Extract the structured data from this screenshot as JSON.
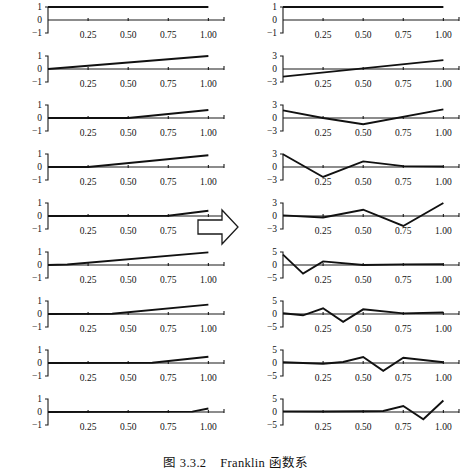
{
  "figure": {
    "caption_label": "图",
    "caption_number": "3.3.2",
    "caption_text": "Franklin 函数系",
    "arrow_icon": "right-block-arrow-icon",
    "line_color": "#111111",
    "axis_color": "#1a1a1a",
    "background_color": "#ffffff"
  },
  "chart_data": [
    {
      "type": "line",
      "panel_id": "left-1",
      "column": "left",
      "index": 1,
      "title": "",
      "xlabel": "",
      "ylabel": "",
      "xlim": [
        0,
        1.06
      ],
      "ylim": [
        -1,
        1
      ],
      "yticks": [
        1,
        0,
        -1
      ],
      "yticklabels": [
        "1",
        "0",
        "-1"
      ],
      "xticks": [
        0.25,
        0.5,
        0.75,
        1.0
      ],
      "xticklabels": [
        "0.25",
        "0.50",
        "0.75",
        "1.00"
      ],
      "grid": false,
      "legend": "none",
      "x": [
        0,
        1
      ],
      "y": [
        1,
        1
      ]
    },
    {
      "type": "line",
      "panel_id": "left-2",
      "column": "left",
      "index": 2,
      "xlim": [
        0,
        1.06
      ],
      "ylim": [
        -1,
        1
      ],
      "yticks": [
        1,
        0,
        -1
      ],
      "yticklabels": [
        "1",
        "0",
        "-1"
      ],
      "xticks": [
        0.25,
        0.5,
        0.75,
        1.0
      ],
      "xticklabels": [
        "0.25",
        "0.50",
        "0.75",
        "1.00"
      ],
      "grid": false,
      "x": [
        0,
        1
      ],
      "y": [
        0,
        1
      ]
    },
    {
      "type": "line",
      "panel_id": "left-3",
      "column": "left",
      "index": 3,
      "xlim": [
        0,
        1.06
      ],
      "ylim": [
        -1,
        1
      ],
      "yticks": [
        1,
        0,
        -1
      ],
      "yticklabels": [
        "1",
        "0",
        "-1"
      ],
      "xticks": [
        0.25,
        0.5,
        0.75,
        1.0
      ],
      "xticklabels": [
        "0.25",
        "0.50",
        "0.75",
        "1.00"
      ],
      "grid": false,
      "x": [
        0,
        0.5,
        1
      ],
      "y": [
        0,
        0,
        0.62
      ]
    },
    {
      "type": "line",
      "panel_id": "left-4",
      "column": "left",
      "index": 4,
      "xlim": [
        0,
        1.06
      ],
      "ylim": [
        -1,
        1
      ],
      "yticks": [
        1,
        0,
        -1
      ],
      "yticklabels": [
        "1",
        "0",
        "-1"
      ],
      "xticks": [
        0.25,
        0.5,
        0.75,
        1.0
      ],
      "xticklabels": [
        "0.25",
        "0.50",
        "0.75",
        "1.00"
      ],
      "grid": false,
      "x": [
        0,
        0.25,
        1
      ],
      "y": [
        0,
        0,
        0.9
      ]
    },
    {
      "type": "line",
      "panel_id": "left-5",
      "column": "left",
      "index": 5,
      "xlim": [
        0,
        1.06
      ],
      "ylim": [
        -1,
        1
      ],
      "yticks": [
        1,
        0,
        -1
      ],
      "yticklabels": [
        "1",
        "0",
        "-1"
      ],
      "xticks": [
        0.25,
        0.5,
        0.75,
        1.0
      ],
      "xticklabels": [
        "0.25",
        "0.50",
        "0.75",
        "1.00"
      ],
      "grid": false,
      "x": [
        0,
        0.75,
        1
      ],
      "y": [
        0,
        0.02,
        0.4
      ]
    },
    {
      "type": "line",
      "panel_id": "left-6",
      "column": "left",
      "index": 6,
      "xlim": [
        0,
        1.06
      ],
      "ylim": [
        -1,
        1
      ],
      "yticks": [
        1,
        0,
        -1
      ],
      "yticklabels": [
        "1",
        "0",
        "-1"
      ],
      "xticks": [
        0.25,
        0.5,
        0.75,
        1.0
      ],
      "xticklabels": [
        "0.25",
        "0.50",
        "0.75",
        "1.00"
      ],
      "grid": false,
      "x": [
        0,
        0.12,
        1
      ],
      "y": [
        0,
        0.04,
        0.97
      ]
    },
    {
      "type": "line",
      "panel_id": "left-7",
      "column": "left",
      "index": 7,
      "xlim": [
        0,
        1.06
      ],
      "ylim": [
        -1,
        1
      ],
      "yticks": [
        1,
        0,
        -1
      ],
      "yticklabels": [
        "1",
        "0",
        "-1"
      ],
      "xticks": [
        0.25,
        0.5,
        0.75,
        1.0
      ],
      "xticklabels": [
        "0.25",
        "0.50",
        "0.75",
        "1.00"
      ],
      "grid": false,
      "x": [
        0,
        0.4,
        1
      ],
      "y": [
        0,
        0.02,
        0.72
      ]
    },
    {
      "type": "line",
      "panel_id": "left-8",
      "column": "left",
      "index": 8,
      "xlim": [
        0,
        1.06
      ],
      "ylim": [
        -1,
        1
      ],
      "yticks": [
        1,
        0,
        -1
      ],
      "yticklabels": [
        "1",
        "0",
        "-1"
      ],
      "xticks": [
        0.25,
        0.5,
        0.75,
        1.0
      ],
      "xticklabels": [
        "0.25",
        "0.50",
        "0.75",
        "1.00"
      ],
      "grid": false,
      "x": [
        0,
        0.65,
        1
      ],
      "y": [
        0,
        0.02,
        0.48
      ]
    },
    {
      "type": "line",
      "panel_id": "left-9",
      "column": "left",
      "index": 9,
      "xlim": [
        0,
        1.06
      ],
      "ylim": [
        -1,
        1
      ],
      "yticks": [
        1,
        0,
        -1
      ],
      "yticklabels": [
        "1",
        "0",
        "-1"
      ],
      "xticks": [
        0.25,
        0.5,
        0.75,
        1.0
      ],
      "xticklabels": [
        "0.25",
        "0.50",
        "0.75",
        "1.00"
      ],
      "grid": false,
      "x": [
        0,
        0.9,
        1
      ],
      "y": [
        0,
        0.03,
        0.27
      ]
    },
    {
      "type": "line",
      "panel_id": "right-1",
      "column": "right",
      "index": 1,
      "xlim": [
        0,
        1.06
      ],
      "ylim": [
        -1,
        1
      ],
      "yticks": [
        1,
        0,
        -1
      ],
      "yticklabels": [
        "1",
        "0",
        "-1"
      ],
      "xticks": [
        0.25,
        0.5,
        0.75,
        1.0
      ],
      "xticklabels": [
        "0.25",
        "0.50",
        "0.75",
        "1.00"
      ],
      "grid": false,
      "x": [
        0,
        1
      ],
      "y": [
        1,
        1
      ]
    },
    {
      "type": "line",
      "panel_id": "right-2",
      "column": "right",
      "index": 2,
      "xlim": [
        0,
        1.06
      ],
      "ylim": [
        -3,
        3
      ],
      "yticks": [
        3,
        0,
        -3
      ],
      "yticklabels": [
        "3",
        "0",
        "-3"
      ],
      "xticks": [
        0.25,
        0.5,
        0.75,
        1.0
      ],
      "xticklabels": [
        "0.25",
        "0.50",
        "0.75",
        "1.00"
      ],
      "grid": false,
      "x": [
        0,
        1
      ],
      "y": [
        -1.75,
        2.05
      ]
    },
    {
      "type": "line",
      "panel_id": "right-3",
      "column": "right",
      "index": 3,
      "xlim": [
        0,
        1.06
      ],
      "ylim": [
        -3,
        3
      ],
      "yticks": [
        3,
        0,
        -3
      ],
      "yticklabels": [
        "3",
        "0",
        "-3"
      ],
      "xticks": [
        0.25,
        0.5,
        0.75,
        1.0
      ],
      "xticklabels": [
        "0.25",
        "0.50",
        "0.75",
        "1.00"
      ],
      "grid": false,
      "x": [
        0,
        0.25,
        0.5,
        1
      ],
      "y": [
        1.75,
        0,
        -1.45,
        2.0
      ]
    },
    {
      "type": "line",
      "panel_id": "right-4",
      "column": "right",
      "index": 4,
      "xlim": [
        0,
        1.06
      ],
      "ylim": [
        -3,
        3
      ],
      "yticks": [
        3,
        0,
        -3
      ],
      "yticklabels": [
        "3",
        "0",
        "-3"
      ],
      "xticks": [
        0.25,
        0.5,
        0.75,
        1.0
      ],
      "xticklabels": [
        "0.25",
        "0.50",
        "0.75",
        "1.00"
      ],
      "grid": false,
      "x": [
        0,
        0.25,
        0.5,
        0.75,
        1
      ],
      "y": [
        2.95,
        -2.3,
        1.3,
        0.2,
        0.1
      ]
    },
    {
      "type": "line",
      "panel_id": "right-5",
      "column": "right",
      "index": 5,
      "xlim": [
        0,
        1.06
      ],
      "ylim": [
        -3,
        3
      ],
      "yticks": [
        3,
        0,
        -3
      ],
      "yticklabels": [
        "3",
        "0",
        "-3"
      ],
      "xticks": [
        0.25,
        0.5,
        0.75,
        1.0
      ],
      "xticklabels": [
        "0.25",
        "0.50",
        "0.75",
        "1.00"
      ],
      "grid": false,
      "x": [
        0,
        0.25,
        0.5,
        0.75,
        1
      ],
      "y": [
        0.15,
        -0.35,
        1.45,
        -2.3,
        3.0
      ]
    },
    {
      "type": "line",
      "panel_id": "right-6",
      "column": "right",
      "index": 6,
      "xlim": [
        0,
        1.06
      ],
      "ylim": [
        -5,
        5
      ],
      "yticks": [
        5,
        0,
        -5
      ],
      "yticklabels": [
        "5",
        "0",
        "-5"
      ],
      "xticks": [
        0.25,
        0.5,
        0.75,
        1.0
      ],
      "xticklabels": [
        "0.25",
        "0.50",
        "0.75",
        "1.00"
      ],
      "grid": false,
      "x": [
        0,
        0.125,
        0.25,
        0.5,
        0.75,
        1
      ],
      "y": [
        4.0,
        -3.3,
        1.4,
        0.0,
        0.25,
        0.3
      ]
    },
    {
      "type": "line",
      "panel_id": "right-7",
      "column": "right",
      "index": 7,
      "xlim": [
        0,
        1.06
      ],
      "ylim": [
        -5,
        5
      ],
      "yticks": [
        5,
        0,
        -5
      ],
      "yticklabels": [
        "5",
        "0",
        "-5"
      ],
      "xticks": [
        0.25,
        0.5,
        0.75,
        1.0
      ],
      "xticklabels": [
        "0.25",
        "0.50",
        "0.75",
        "1.00"
      ],
      "grid": false,
      "x": [
        0,
        0.125,
        0.25,
        0.375,
        0.5,
        0.75,
        1
      ],
      "y": [
        0.3,
        -0.5,
        2.2,
        -3.0,
        1.8,
        0.25,
        0.6
      ]
    },
    {
      "type": "line",
      "panel_id": "right-8",
      "column": "right",
      "index": 8,
      "xlim": [
        0,
        1.06
      ],
      "ylim": [
        -5,
        5
      ],
      "yticks": [
        5,
        0,
        -5
      ],
      "yticklabels": [
        "5",
        "0",
        "-5"
      ],
      "xticks": [
        0.25,
        0.5,
        0.75,
        1.0
      ],
      "xticklabels": [
        "0.25",
        "0.50",
        "0.75",
        "1.00"
      ],
      "grid": false,
      "x": [
        0,
        0.25,
        0.375,
        0.5,
        0.625,
        0.75,
        1
      ],
      "y": [
        0.3,
        -0.3,
        0.4,
        2.3,
        -3.0,
        2.0,
        0.3
      ]
    },
    {
      "type": "line",
      "panel_id": "right-9",
      "column": "right",
      "index": 9,
      "xlim": [
        0,
        1.06
      ],
      "ylim": [
        -5,
        5
      ],
      "yticks": [
        5,
        0,
        -5
      ],
      "yticklabels": [
        "5",
        "0",
        "-5"
      ],
      "xticks": [
        0.25,
        0.5,
        0.75,
        1.0
      ],
      "xticklabels": [
        "0.25",
        "0.50",
        "0.75",
        "1.00"
      ],
      "grid": false,
      "x": [
        0,
        0.25,
        0.5,
        0.625,
        0.75,
        0.875,
        1
      ],
      "y": [
        0.25,
        0.2,
        0.3,
        0.4,
        2.3,
        -2.8,
        4.4
      ]
    }
  ]
}
